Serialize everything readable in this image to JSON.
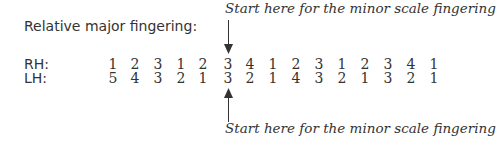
{
  "title": "Relative major fingering:",
  "note_top": "Start here for the minor scale fingering",
  "note_bottom": "Start here for the minor scale fingering",
  "rows": [
    {
      "label": "RH:",
      "values": [
        "1",
        "2",
        "3",
        "1",
        "2",
        "3",
        "4",
        "1",
        "2",
        "3",
        "1",
        "2",
        "3",
        "4",
        "1"
      ]
    },
    {
      "label": "LH:",
      "values": [
        "5",
        "4",
        "3",
        "2",
        "1",
        "3",
        "2",
        "1",
        "4",
        "3",
        "2",
        "1",
        "3",
        "2",
        "1"
      ]
    }
  ],
  "highlight_index": 5
}
